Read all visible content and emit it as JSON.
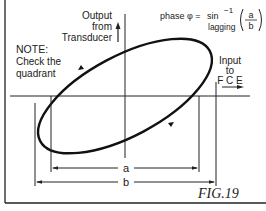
{
  "figure": {
    "label": "FIG.19",
    "note": {
      "title": "NOTE:",
      "line1": "Check the",
      "line2": "quadrant"
    },
    "y_axis": {
      "line1": "Output",
      "line2": "from",
      "line3": "Transducer"
    },
    "x_axis": {
      "line1": "Input",
      "line2": "to",
      "line3": "F C E"
    },
    "formula": {
      "prefix": "phase φ = ",
      "func": "sin",
      "exponent": "−1",
      "numerator": "a",
      "denominator": "b",
      "qualifier": "lagging"
    },
    "dimensions": {
      "a_label": "a",
      "b_label": "b"
    }
  },
  "colors": {
    "stroke": "#111111",
    "text": "#222222",
    "background": "#ffffff"
  }
}
